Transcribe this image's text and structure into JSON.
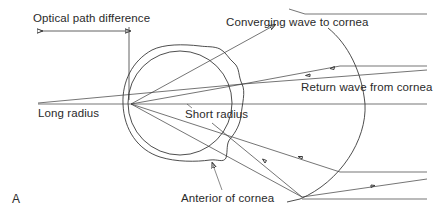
{
  "figure": {
    "panel_label": "A",
    "labels": {
      "optical_path_difference": "Optical path difference",
      "converging_wave": "Converging wave to cornea",
      "return_wave": "Return wave from cornea",
      "long_radius": "Long radius",
      "short_radius": "Short radius",
      "anterior_cornea": "Anterior of cornea"
    },
    "colors": {
      "background": "#ffffff",
      "line": "#3a3a3a",
      "text": "#2a2a2a"
    }
  }
}
